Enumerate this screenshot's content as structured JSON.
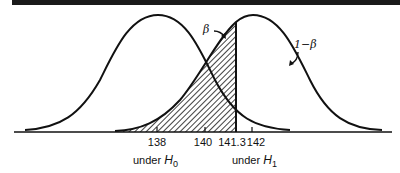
{
  "figure": {
    "type": "two overlapping normal distributions (hypothesis test power diagram)",
    "top_bar_color": "#1a1a1a",
    "line_color": "#111111",
    "labels": {
      "beta": "β",
      "one_minus_beta": "1−β",
      "under_h0_prefix": "under ",
      "under_h0_var": "H",
      "under_h0_sub": "0",
      "under_h1_prefix": "under ",
      "under_h1_var": "H",
      "under_h1_sub": "1"
    },
    "ticks": [
      {
        "label": "138",
        "x": 157
      },
      {
        "label": "140",
        "x": 205
      },
      {
        "label": "141.3",
        "x": 236
      },
      {
        "label": "142",
        "x": 252
      }
    ],
    "distributions": [
      {
        "name": "H0",
        "mean": 138
      },
      {
        "name": "H1",
        "mean": 142
      }
    ],
    "critical_value": "141.3",
    "shaded_region": "area under H1 curve left of critical value 141.3 (β)"
  }
}
